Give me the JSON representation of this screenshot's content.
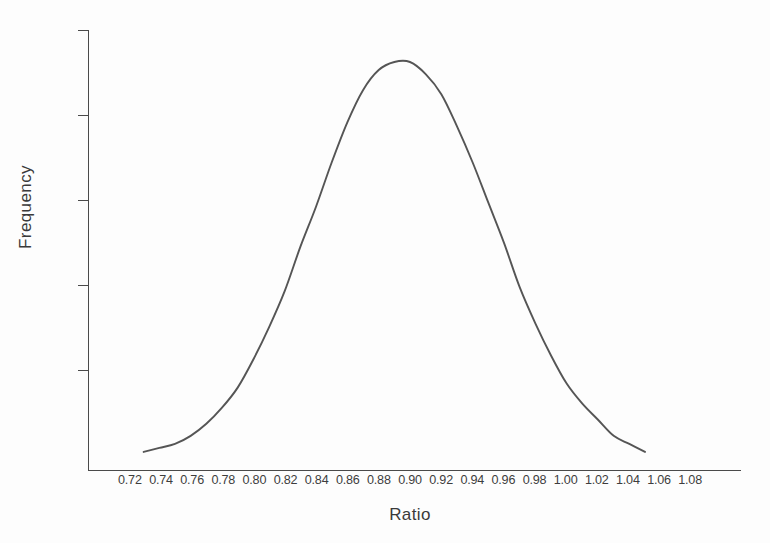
{
  "chart_data": {
    "type": "line",
    "title": "",
    "subtitle": "",
    "xlabel": "Ratio",
    "ylabel": "Frequency",
    "grid": false,
    "legend_position": "none",
    "annotations": [],
    "xlim": [
      0.71,
      1.095
    ],
    "ylim": [
      0,
      1.06
    ],
    "y_axis_tick_labels": [],
    "y_axis_tick_count": 5,
    "x_tick_labels": [
      "0.72",
      "0.74",
      "0.76",
      "0.78",
      "0.80",
      "0.82",
      "0.84",
      "0.86",
      "0.88",
      "0.90",
      "0.92",
      "0.94",
      "0.96",
      "0.98",
      "1.00",
      "1.02",
      "1.04",
      "1.06",
      "1.08"
    ],
    "series": [
      {
        "name": "Frequency distribution",
        "color": "#555555",
        "x": [
          0.73,
          0.74,
          0.75,
          0.76,
          0.77,
          0.78,
          0.79,
          0.8,
          0.81,
          0.82,
          0.83,
          0.84,
          0.85,
          0.86,
          0.87,
          0.88,
          0.89,
          0.9,
          0.91,
          0.92,
          0.93,
          0.94,
          0.95,
          0.96,
          0.97,
          0.98,
          0.99,
          1.0,
          1.01,
          1.02,
          1.03,
          1.04,
          1.05
        ],
        "values": [
          0.03,
          0.04,
          0.05,
          0.07,
          0.1,
          0.14,
          0.19,
          0.26,
          0.34,
          0.43,
          0.54,
          0.64,
          0.75,
          0.85,
          0.93,
          0.98,
          1.0,
          1.0,
          0.97,
          0.92,
          0.84,
          0.75,
          0.65,
          0.55,
          0.44,
          0.35,
          0.27,
          0.2,
          0.15,
          0.11,
          0.07,
          0.05,
          0.03
        ]
      }
    ]
  },
  "labels": {
    "x_axis_title": "Ratio",
    "y_axis_title": "Frequency"
  },
  "colors": {
    "curve": "#555555",
    "axis": "#4a4a4a",
    "background": "#fdfdfd",
    "text": "#3a3a3a"
  }
}
